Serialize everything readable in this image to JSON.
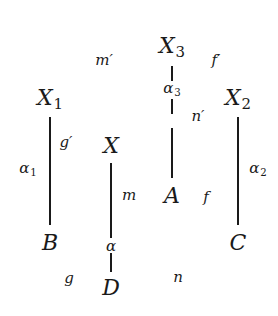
{
  "diagram": {
    "type": "commutative-diagram",
    "nodes": [
      {
        "id": "X3",
        "base": "X",
        "sub": "3",
        "x": 172,
        "y": 48
      },
      {
        "id": "X1",
        "base": "X",
        "sub": "1",
        "x": 50,
        "y": 100
      },
      {
        "id": "X2",
        "base": "X",
        "sub": "2",
        "x": 238,
        "y": 100
      },
      {
        "id": "X",
        "base": "X",
        "sub": "",
        "x": 111,
        "y": 146
      },
      {
        "id": "A",
        "base": "A",
        "sub": "",
        "x": 172,
        "y": 196
      },
      {
        "id": "B",
        "base": "B",
        "sub": "",
        "x": 50,
        "y": 243
      },
      {
        "id": "C",
        "base": "C",
        "sub": "",
        "x": 238,
        "y": 243
      },
      {
        "id": "D",
        "base": "D",
        "sub": "",
        "x": 111,
        "y": 288
      }
    ],
    "edge_labels": [
      {
        "id": "m_prime",
        "base": "m′",
        "sub": "",
        "x": 104,
        "y": 60
      },
      {
        "id": "f_prime",
        "base": "f′",
        "sub": "",
        "x": 216,
        "y": 60
      },
      {
        "id": "alpha3",
        "base": "α",
        "sub": "3",
        "x": 172,
        "y": 90
      },
      {
        "id": "n_prime",
        "base": "n′",
        "sub": "",
        "x": 198,
        "y": 116
      },
      {
        "id": "g_prime",
        "base": "g′",
        "sub": "",
        "x": 66,
        "y": 142
      },
      {
        "id": "alpha1",
        "base": "α",
        "sub": "1",
        "x": 28,
        "y": 170
      },
      {
        "id": "alpha2",
        "base": "α",
        "sub": "2",
        "x": 258,
        "y": 170
      },
      {
        "id": "m",
        "base": "m",
        "sub": "",
        "x": 129,
        "y": 195
      },
      {
        "id": "f",
        "base": "f",
        "sub": "",
        "x": 206,
        "y": 197
      },
      {
        "id": "alpha",
        "base": "α",
        "sub": "",
        "x": 111,
        "y": 246
      },
      {
        "id": "g",
        "base": "g",
        "sub": "",
        "x": 69,
        "y": 278
      },
      {
        "id": "n",
        "base": "n",
        "sub": "",
        "x": 178,
        "y": 277
      }
    ],
    "vertical_edges": [
      {
        "from": "X1",
        "to": "B",
        "x": 50,
        "y1": 117,
        "y2": 225,
        "label": "α1"
      },
      {
        "from": "X3",
        "to": "A",
        "x": 172,
        "y1": 66,
        "y2": 81,
        "label": "α3"
      },
      {
        "from": "X3",
        "to": "A",
        "x": 172,
        "y1": 99,
        "y2": 114,
        "label": "α3"
      },
      {
        "from": "X3",
        "to": "A",
        "x": 172,
        "y1": 128,
        "y2": 178,
        "label": "α3"
      },
      {
        "from": "X2",
        "to": "C",
        "x": 238,
        "y1": 117,
        "y2": 225,
        "label": "α2"
      },
      {
        "from": "X",
        "to": "D",
        "x": 111,
        "y1": 163,
        "y2": 238,
        "label": "α"
      },
      {
        "from": "X",
        "to": "D",
        "x": 111,
        "y1": 253,
        "y2": 272,
        "label": "α"
      }
    ]
  }
}
